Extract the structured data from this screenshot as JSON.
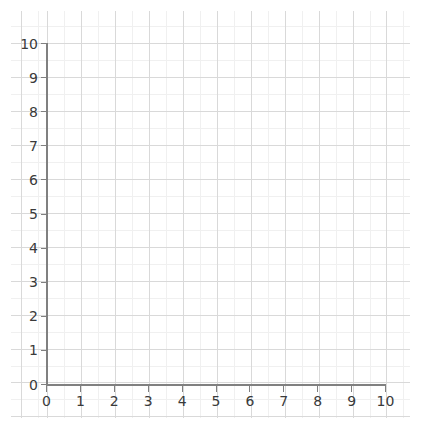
{
  "chart_data": {
    "type": "scatter",
    "title": "",
    "subtitle": "",
    "xlabel": "",
    "ylabel": "",
    "xlim": [
      0,
      10
    ],
    "ylim": [
      0,
      10
    ],
    "xticks": [
      0,
      1,
      2,
      3,
      4,
      5,
      6,
      7,
      8,
      9,
      10
    ],
    "yticks": [
      0,
      1,
      2,
      3,
      4,
      5,
      6,
      7,
      8,
      9,
      10
    ],
    "xtick_labels": [
      "0",
      "1",
      "2",
      "3",
      "4",
      "5",
      "6",
      "7",
      "8",
      "9",
      "10"
    ],
    "ytick_labels": [
      "0",
      "1",
      "2",
      "3",
      "4",
      "5",
      "6",
      "7",
      "8",
      "9",
      "10"
    ],
    "grid": true,
    "minor_grid": true,
    "minor_ticks_per_unit": 2,
    "legend": null,
    "legend_position": "none",
    "series": [],
    "annotations": []
  },
  "style": {
    "background_color": "#ffffff",
    "axis_color": "#808080",
    "major_grid_color": "#d9d9d9",
    "minor_grid_color": "#f0f0f0",
    "tick_label_color": "#3a3a3a"
  }
}
